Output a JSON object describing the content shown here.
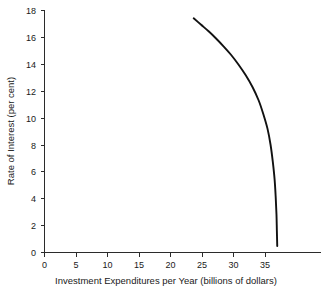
{
  "chart_data": {
    "type": "line",
    "title": "",
    "subtitle": "",
    "xlabel": "Investment Expenditures per Year (billions of dollars)",
    "ylabel": "Rate of Interest (per cent)",
    "xlim": [
      0,
      37
    ],
    "ylim": [
      0,
      18.6
    ],
    "xticks": [
      0,
      5,
      10,
      15,
      20,
      25,
      30,
      35
    ],
    "xtick_labels": [
      "0",
      "5",
      "10",
      "15",
      "20",
      "25",
      "30",
      "35"
    ],
    "yticks": [
      0,
      2,
      4,
      6,
      8,
      10,
      12,
      14,
      16,
      18
    ],
    "ytick_labels": [
      "0",
      "2",
      "4",
      "6",
      "8",
      "10",
      "12",
      "14",
      "16",
      "18"
    ],
    "grid": false,
    "legend": "none",
    "series": [
      {
        "name": "Investment demand curve",
        "color": "#111111",
        "x": [
          20.0,
          21.0,
          22.0,
          23.0,
          24.0,
          25.0,
          26.0,
          27.0,
          27.9,
          28.7,
          29.3,
          29.9,
          30.3,
          30.6,
          30.85,
          31.0,
          31.1,
          31.15,
          31.2
        ],
        "y": [
          18.0,
          17.5,
          17.0,
          16.45,
          15.85,
          15.2,
          14.45,
          13.6,
          12.7,
          11.7,
          10.7,
          9.5,
          8.3,
          7.0,
          5.6,
          4.2,
          2.9,
          1.7,
          0.5
        ]
      }
    ],
    "annotations": []
  },
  "figure": {
    "caption": ""
  },
  "colors": {
    "curve": "#111111",
    "axis": "#2b2b2b",
    "background": "#ffffff",
    "text": "#1a1a1a"
  }
}
